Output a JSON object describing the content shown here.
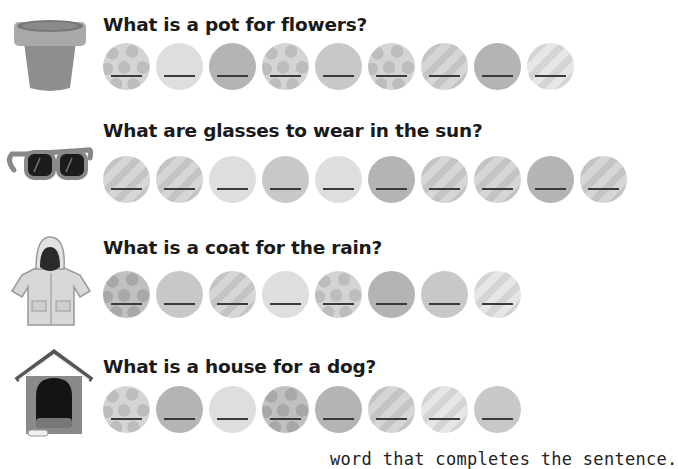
{
  "questions": [
    {
      "id": "pot",
      "text": "What is a pot for flowers?",
      "picture": "flower-pot",
      "circles": [
        "dots",
        "light",
        "dark",
        "dots",
        "mid",
        "dots",
        "stripe",
        "dark",
        "stripe-light"
      ]
    },
    {
      "id": "sunglasses",
      "text": "What are glasses to wear in the sun?",
      "picture": "sunglasses",
      "circles": [
        "stripe",
        "stripe",
        "light",
        "mid",
        "light",
        "dark",
        "stripe",
        "stripe",
        "dark",
        "stripe"
      ]
    },
    {
      "id": "raincoat",
      "text": "What is a coat for the rain?",
      "picture": "raincoat",
      "circles": [
        "dots-dark",
        "mid",
        "stripe",
        "light",
        "dots",
        "dark",
        "mid",
        "stripe-light"
      ]
    },
    {
      "id": "doghouse",
      "text": "What is a house for a dog?",
      "picture": "doghouse",
      "circles": [
        "dots",
        "dark",
        "light",
        "dots-dark",
        "dark",
        "stripe",
        "stripe-light",
        "mid"
      ]
    }
  ],
  "footer": {
    "instruction": "word that completes the sentence."
  },
  "colors": {
    "text": "#1a1a1a",
    "blank_line": "#3a3a3a",
    "circle_light": "#dedede",
    "circle_mid": "#c8c8c8",
    "circle_dark": "#b4b4b4"
  }
}
